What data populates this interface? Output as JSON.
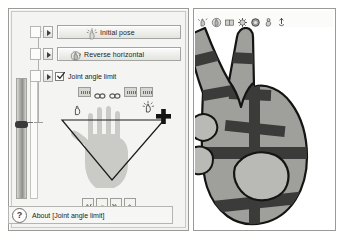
{
  "app": {
    "left_panel_title": "Hand pose editor",
    "right_panel_title": "Hand preview"
  },
  "buttons": [
    {
      "id": "initial-pose",
      "label": "Initial pose",
      "icon": "sparkle-hand-icon"
    },
    {
      "id": "reverse-horizontal",
      "label": "Reverse horizontal",
      "icon": "mirror-hand-icon"
    }
  ],
  "checkbox": {
    "label": "Joint angle limit",
    "checked": true,
    "check_mark": "✔"
  },
  "arrow_buttons": [
    {
      "id": "expand-row-1",
      "glyph": "▶"
    },
    {
      "id": "expand-row-2",
      "glyph": "▶"
    },
    {
      "id": "expand-row-3",
      "glyph": "▶"
    }
  ],
  "slider": {
    "name": "joint-angle-slider",
    "orientation": "vertical",
    "thumb_position_percent": 44
  },
  "joint_icon_row": [
    {
      "id": "joint-icon-1",
      "type": "slider-swatch",
      "name": "joint-swatch-icon"
    },
    {
      "id": "joint-icon-2",
      "type": "link",
      "name": "chain-link-icon"
    },
    {
      "id": "joint-icon-3",
      "type": "link",
      "name": "chain-link-icon"
    },
    {
      "id": "joint-icon-4",
      "type": "slider-swatch",
      "name": "joint-swatch-icon"
    },
    {
      "id": "joint-icon-5",
      "type": "slider-swatch",
      "name": "joint-swatch-icon"
    }
  ],
  "hand_diagram": {
    "name": "hand-palm-diagram",
    "left_marker": "grab-hand-icon",
    "right_marker": "spread-hand-icon",
    "selection_marker": "crosshair-plus-marker",
    "shape": "triangle-selection"
  },
  "bottom_toolbar": [
    {
      "id": "tool-rotate-left",
      "name": "rotate-left-hand-icon"
    },
    {
      "id": "tool-fist",
      "name": "fist-hand-icon"
    },
    {
      "id": "tool-rotate-right",
      "name": "rotate-right-hand-icon"
    },
    {
      "id": "tool-side-hand",
      "name": "side-hand-icon"
    }
  ],
  "about": {
    "icon": "question-mark-icon",
    "icon_glyph": "?",
    "text": "About [Joint angle limit]"
  },
  "right_toolbar": [
    {
      "id": "rt-1",
      "name": "zoom-in-hand-icon"
    },
    {
      "id": "rt-2",
      "name": "zoom-out-hand-icon"
    },
    {
      "id": "rt-3",
      "name": "flip-hand-icon"
    },
    {
      "id": "rt-4",
      "name": "gear-hand-icon"
    },
    {
      "id": "rt-5",
      "name": "rotate-hand-icon"
    },
    {
      "id": "rt-6",
      "name": "save-hand-icon"
    },
    {
      "id": "rt-7",
      "name": "export-hand-icon"
    }
  ],
  "preview": {
    "name": "v-sign-hand-illustration",
    "pose": "V sign (peace)",
    "fill": "#9f9f9c",
    "outline": "#1a1a1a"
  },
  "colors": {
    "window_bg": "#f2f2f0",
    "border": "#9a9a96",
    "text": "#1d1d1b",
    "hand_fill": "#9f9f9c",
    "band": "#3b3b39"
  }
}
